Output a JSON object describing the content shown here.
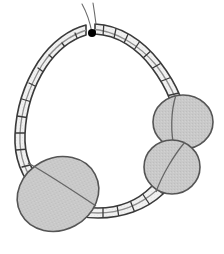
{
  "figure": {
    "title": "Segmented loop structure with three lobed masses",
    "caption": "",
    "canvas": {
      "width": 224,
      "height": 254,
      "background": "#ffffff"
    },
    "colors": {
      "background": "#ffffff",
      "band_fill": "#f1f1f1",
      "band_stroke": "#3a3a3a",
      "band_midline": "#8e8e8e",
      "lobe_fill": "#c9c9c9",
      "lobe_stroke": "#555555",
      "junction_dot": "#000000",
      "thin_line": "#6b6b6b"
    },
    "stroke_widths": {
      "band_outline": 1.6,
      "band_rung": 1.3,
      "band_midline": 1.2,
      "lobe_outline": 1.6,
      "thin_line": 1.1
    }
  },
  "parts": {
    "band": {
      "label": "segmented-band-loop",
      "shape": "teardrop-loop",
      "description": "A ribbon-like segmented band forming a closed heart/teardrop loop, widest at the bottom, converging at a junction near the top center.",
      "segment_count": 27,
      "has_central_midline": true
    },
    "junction": {
      "label": "apex-junction-node",
      "x": 92,
      "y": 33,
      "radius": 4,
      "description": "Filled black node where the two band limbs meet at the top apex."
    },
    "thin_tail": {
      "label": "thin-tail-line",
      "description": "Thin free line continuing upward and curving left beyond the apex junction."
    },
    "lobes": [
      {
        "id": "lobe-lower-left",
        "label": "large-lower-left-lobe",
        "cx": 58,
        "cy": 194,
        "rx": 42,
        "ry": 36,
        "rotation": -28,
        "size_rank": 1
      },
      {
        "id": "lobe-upper-right",
        "label": "upper-right-lobe",
        "cx": 183,
        "cy": 122,
        "rx": 30,
        "ry": 27,
        "rotation": 0,
        "size_rank": 2
      },
      {
        "id": "lobe-lower-right",
        "label": "lower-right-lobe",
        "cx": 172,
        "cy": 167,
        "rx": 28,
        "ry": 27,
        "rotation": 0,
        "size_rank": 3
      }
    ]
  },
  "annotations": {
    "visible_text": []
  }
}
